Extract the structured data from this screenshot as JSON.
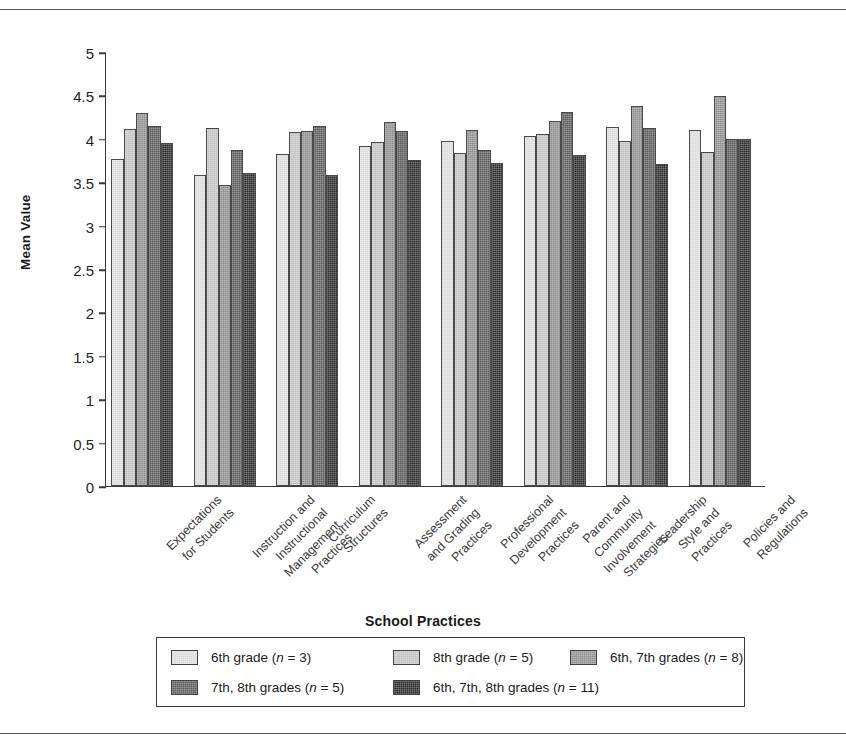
{
  "chart_data": {
    "type": "bar",
    "title": "",
    "xlabel": "School Practices",
    "ylabel": "Mean Value",
    "ylim": [
      0,
      5
    ],
    "ytick_step": 0.5,
    "yticks": [
      "5",
      "4.5",
      "4",
      "3.5",
      "3",
      "2.5",
      "2",
      "1.5",
      "1",
      "0.5",
      "0"
    ],
    "grid": false,
    "legend_position": "bottom",
    "categories": [
      "Expectations\nfor Students",
      "Instruction and\nInstructional\nManagement\nPractices",
      "Curriculum\nStructures",
      "Assessment\nand Grading\nPractices",
      "Professional\nDevelopment\nPractices",
      "Parent and\nCommunity\nInvolvement\nStrategies",
      "Leadership\nStyle and\nPractices",
      "Policies and\nRegulations"
    ],
    "series": [
      {
        "name": "6th grade (n = 3)",
        "color": "#dcdcdc",
        "values": [
          3.77,
          3.58,
          3.82,
          3.92,
          3.98,
          4.03,
          4.14,
          4.1
        ]
      },
      {
        "name": "8th grade (n = 5)",
        "color": "#c2c2c2",
        "values": [
          4.11,
          4.12,
          4.08,
          3.96,
          3.84,
          4.06,
          3.98,
          3.85
        ]
      },
      {
        "name": "6th, 7th grades (n = 8)",
        "color": "#8f8f8f",
        "values": [
          4.3,
          3.47,
          4.09,
          4.19,
          4.1,
          4.2,
          4.38,
          4.49
        ]
      },
      {
        "name": "7th, 8th grades (n = 5)",
        "color": "#5c5c5c",
        "values": [
          4.15,
          3.87,
          4.15,
          4.09,
          3.87,
          4.31,
          4.13,
          4.0
        ]
      },
      {
        "name": "6th, 7th, 8th grades (n = 11)",
        "color": "#2b2b2b",
        "values": [
          3.95,
          3.61,
          3.58,
          3.76,
          3.72,
          3.81,
          3.71,
          4.0
        ]
      }
    ]
  },
  "axes": {
    "y_title": "Mean Value",
    "x_title": "School Practices"
  },
  "categories_display": [
    [
      "Expectations",
      "for Students"
    ],
    [
      "Instruction and",
      "Instructional",
      "Management",
      "Practices"
    ],
    [
      "Curriculum",
      "Structures"
    ],
    [
      "Assessment",
      "and Grading",
      "Practices"
    ],
    [
      "Professional",
      "Development",
      "Practices"
    ],
    [
      "Parent and",
      "Community",
      "Involvement",
      "Strategies"
    ],
    [
      "Leadership",
      "Style and",
      "Practices"
    ],
    [
      "Policies and",
      "Regulations"
    ]
  ],
  "legend": {
    "items": [
      {
        "label_pre": "6th grade (",
        "n": "n",
        "label_post": " = 3)",
        "color": "#dcdcdc"
      },
      {
        "label_pre": "8th grade (",
        "n": "n",
        "label_post": " = 5)",
        "color": "#c2c2c2"
      },
      {
        "label_pre": "6th, 7th grades (",
        "n": "n",
        "label_post": " = 8)",
        "color": "#8f8f8f"
      },
      {
        "label_pre": "7th, 8th grades (",
        "n": "n",
        "label_post": " = 5)",
        "color": "#5c5c5c"
      },
      {
        "label_pre": "6th, 7th, 8th grades (",
        "n": "n",
        "label_post": " = 11)",
        "color": "#2b2b2b"
      }
    ]
  }
}
